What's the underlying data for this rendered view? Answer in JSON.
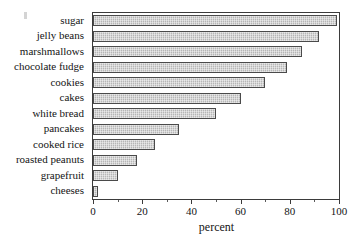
{
  "chart_data": {
    "type": "bar",
    "orientation": "horizontal",
    "title": "",
    "xlabel": "percent",
    "ylabel": "",
    "xlim": [
      0,
      100
    ],
    "xticks": [
      0,
      20,
      40,
      60,
      80,
      100
    ],
    "xtick_labels": [
      "0",
      "20",
      "40",
      "60",
      "80",
      "100"
    ],
    "minor_tick_interval": 10,
    "grid": false,
    "legend": false,
    "categories": [
      "sugar",
      "jelly beans",
      "marshmallows",
      "chocolate fudge",
      "cookies",
      "cakes",
      "white bread",
      "pancakes",
      "cooked rice",
      "roasted peanuts",
      "grapefruit",
      "cheeses"
    ],
    "values": [
      99,
      92,
      85,
      79,
      70,
      60,
      50,
      35,
      25,
      18,
      10,
      2
    ],
    "bar_fill_color": "#bdbdbd",
    "bar_border_color": "#4a4a4a",
    "axis_color": "#3b3b3b"
  }
}
